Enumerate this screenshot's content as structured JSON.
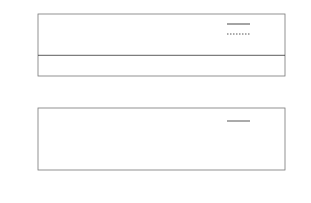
{
  "chart_data": [
    {
      "type": "line",
      "title": "",
      "xlabel": "time",
      "ylabel": "",
      "xlim": [
        0,
        100
      ],
      "ylim": [
        -0.1,
        0.2
      ],
      "xticks": [
        "0",
        "20",
        "40",
        "60",
        "80",
        "100"
      ],
      "yticks": [
        "0.2",
        "0.1",
        "0.0",
        "-0.1"
      ],
      "grid": false,
      "zero_line": true,
      "legend_position": "upper right",
      "series": [
        {
          "name": "x1",
          "style": "solid",
          "description": "damped oscillation from 0.15 settling to sustained oscillation, amplitude ~0.04 about 0.01, period ~7.3",
          "x": [
            0,
            1,
            2,
            3,
            4,
            5,
            6,
            7,
            8,
            9,
            10,
            12,
            14,
            16,
            18,
            20,
            30,
            40,
            50,
            60,
            70,
            80,
            90,
            100
          ],
          "values": [
            0.15,
            0.13,
            0.06,
            -0.02,
            -0.05,
            -0.03,
            0.03,
            0.08,
            0.07,
            0.02,
            -0.02,
            0.01,
            0.05,
            0.02,
            -0.03,
            0.02,
            0.05,
            0.05,
            0.05,
            0.05,
            0.05,
            0.05,
            0.05,
            -0.03
          ]
        },
        {
          "name": "x2",
          "style": "dotted",
          "description": "same as x1 with a small phase lag",
          "x": [
            0,
            1,
            2,
            3,
            4,
            5,
            6,
            7,
            8,
            9,
            10,
            12,
            14,
            16,
            18,
            20,
            30,
            40,
            50,
            60,
            70,
            80,
            90,
            100
          ],
          "values": [
            0.14,
            0.14,
            0.1,
            0.03,
            -0.03,
            -0.06,
            -0.02,
            0.05,
            0.08,
            0.05,
            0.0,
            -0.01,
            0.04,
            0.04,
            -0.02,
            -0.01,
            0.05,
            0.05,
            0.05,
            0.05,
            0.05,
            0.05,
            0.05,
            -0.02
          ]
        }
      ]
    },
    {
      "type": "line",
      "title": "",
      "xlabel": "time",
      "ylabel": "",
      "xlim": [
        0,
        100
      ],
      "ylim": [
        0.0,
        1.5
      ],
      "xticks": [
        "0",
        "20",
        "40",
        "60",
        "80",
        "100"
      ],
      "yticks": [
        "1.5",
        "1.0",
        "0.5",
        "0.0"
      ],
      "grid": false,
      "legend_position": "upper right",
      "series": [
        {
          "name": "U",
          "style": "solid",
          "description": "periodic triangular pulses; first peak 1.35, second 0.92, then ~0.72",
          "peak_times": [
            1.5,
            7.5,
            14.8,
            22.1,
            29.5,
            36.9,
            44.3,
            51.6,
            59.0,
            66.4,
            73.8,
            81.1,
            88.5,
            95.9
          ],
          "peak_values": [
            1.35,
            0.92,
            0.72,
            0.72,
            0.72,
            0.72,
            0.72,
            0.72,
            0.72,
            0.72,
            0.72,
            0.72,
            0.72,
            0.72
          ]
        }
      ]
    }
  ],
  "top_plot": {
    "xlabel": "time",
    "yticks": [
      "0.2",
      "0.1",
      "0.0",
      "-0.1"
    ],
    "xticks": [
      "0",
      "20",
      "40",
      "60",
      "80",
      "100"
    ],
    "legend": [
      {
        "label": "x1",
        "style": "solid"
      },
      {
        "label": "x2",
        "style": "dotted"
      }
    ]
  },
  "bottom_plot": {
    "xlabel": "time",
    "yticks": [
      "1.5",
      "1.0",
      "0.5",
      "0.0"
    ],
    "xticks": [
      "0",
      "20",
      "40",
      "60",
      "80",
      "100"
    ],
    "legend": [
      {
        "label": "U",
        "style": "solid"
      }
    ]
  },
  "colors": {
    "line": "#333333",
    "frame": "#777777",
    "text": "#333333"
  }
}
